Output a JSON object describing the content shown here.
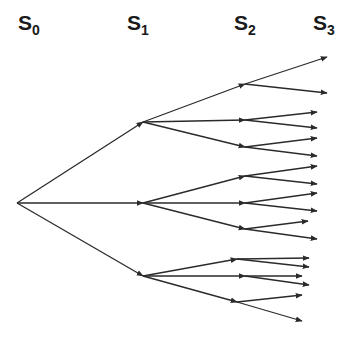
{
  "diagram": {
    "type": "scenario-tree",
    "line_color": "#2a2a2a",
    "stages": [
      {
        "base": "S",
        "sub": "0",
        "x": 18,
        "y": 12
      },
      {
        "base": "S",
        "sub": "1",
        "x": 127,
        "y": 12
      },
      {
        "base": "S",
        "sub": "2",
        "x": 234,
        "y": 12
      },
      {
        "base": "S",
        "sub": "3",
        "x": 313,
        "y": 12
      }
    ],
    "nodes": {
      "root": [
        17,
        203
      ],
      "s1": [
        [
          143,
          122
        ],
        [
          143,
          203
        ],
        [
          143,
          276
        ]
      ],
      "s2": [
        [
          245,
          84
        ],
        [
          245,
          120
        ],
        [
          245,
          147
        ],
        [
          245,
          176
        ],
        [
          245,
          203
        ],
        [
          245,
          229
        ],
        [
          237,
          259
        ],
        [
          245,
          276
        ],
        [
          237,
          302
        ]
      ],
      "s3": [
        [
          [
            327,
            57
          ],
          [
            327,
            93
          ]
        ],
        [
          [
            317,
            112
          ],
          [
            317,
            128
          ]
        ],
        [
          [
            317,
            138
          ],
          [
            317,
            156
          ]
        ],
        [
          [
            317,
            166
          ],
          [
            317,
            184
          ]
        ],
        [
          [
            317,
            193
          ],
          [
            317,
            211
          ]
        ],
        [
          [
            308,
            221
          ],
          [
            317,
            239
          ]
        ],
        [
          [
            309,
            258
          ],
          [
            309,
            267
          ]
        ],
        [
          [
            302,
            276
          ],
          [
            309,
            285
          ]
        ],
        [
          [
            302,
            295
          ],
          [
            302,
            321
          ]
        ]
      ]
    }
  }
}
